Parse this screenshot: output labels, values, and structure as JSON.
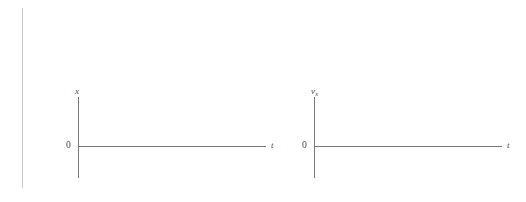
{
  "figure": {
    "background_color": "#ffffff",
    "line_color": "#7a7a7a",
    "rule_color": "#c9c9c9",
    "label_color": "#4a4a4a",
    "width": 526,
    "height": 202
  },
  "margin_rule": {
    "x": 22,
    "y_top": 8,
    "y_bottom": 188
  },
  "plots": [
    {
      "name": "position-vs-time",
      "y_axis_label": "x",
      "y_axis_label_sub": "",
      "x_axis_label": "t",
      "origin_label": "0",
      "geometry": {
        "origin_x": 78,
        "origin_y": 146,
        "y_axis_top": 97,
        "y_axis_bottom": 178,
        "x_axis_right": 266
      }
    },
    {
      "name": "velocity-vs-time",
      "y_axis_label": "v",
      "y_axis_label_sub": "x",
      "x_axis_label": "t",
      "origin_label": "0",
      "geometry": {
        "origin_x": 314,
        "origin_y": 146,
        "y_axis_top": 97,
        "y_axis_bottom": 178,
        "x_axis_right": 502
      }
    }
  ],
  "chart_data": {
    "type": "line",
    "title": "",
    "subtitle": "",
    "panels": [
      {
        "name": "position-vs-time",
        "xlabel": "t",
        "ylabel": "x",
        "x": [],
        "series": [],
        "xlim": [
          0,
          null
        ],
        "ylim": [
          null,
          null
        ],
        "tick_labels": {
          "x": [],
          "y": [
            "0"
          ]
        },
        "grid": false,
        "legend": false,
        "axis_style": "origin-crossing arrows-none, vertical axis extends above and below origin"
      },
      {
        "name": "velocity-vs-time",
        "xlabel": "t",
        "ylabel": "v_x",
        "x": [],
        "series": [],
        "xlim": [
          0,
          null
        ],
        "ylim": [
          null,
          null
        ],
        "tick_labels": {
          "x": [],
          "y": [
            "0"
          ]
        },
        "grid": false,
        "legend": false,
        "axis_style": "origin-crossing arrows-none, vertical axis extends above and below origin"
      }
    ]
  }
}
